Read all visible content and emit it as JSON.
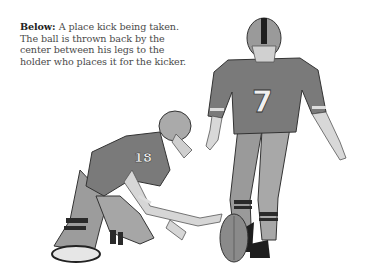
{
  "caption": {
    "label": "Below",
    "separator": ": ",
    "text": "A place kick being taken. The ball is thrown back by the center between his legs to the holder who places it for the kicker."
  },
  "illustration": {
    "kicker_number": "7",
    "holder_number": "18",
    "colors": {
      "jersey": "#7a7a7a",
      "dark": "#2a2a2a",
      "skin": "#d8d8d8",
      "pants": "#a8a8a8",
      "ball": "#8a8a8a"
    }
  }
}
